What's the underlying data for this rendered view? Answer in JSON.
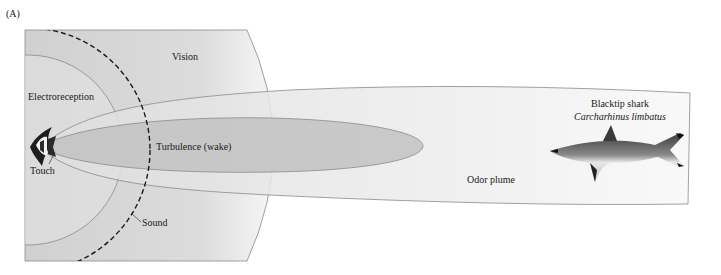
{
  "panel_label": "(A)",
  "regions": {
    "vision": "Vision",
    "electroreception": "Electroreception",
    "turbulence": "Turbulence (wake)",
    "touch": "Touch",
    "sound": "Sound",
    "odor": "Odor plume"
  },
  "predator": {
    "common_name": "Blacktip shark",
    "scientific_name": "Carcharhinus limbatus"
  },
  "prey": {
    "icon": "moorish-idol-fish"
  },
  "colors": {
    "vision_fill": "#d4d4d4",
    "electro_fill": "#e2e2e2",
    "odor_fill": "#ebebeb",
    "turbulence_fill": "#c4c4c4",
    "outline": "#7a7a7a",
    "sound_dash": "#1a1a1a"
  }
}
